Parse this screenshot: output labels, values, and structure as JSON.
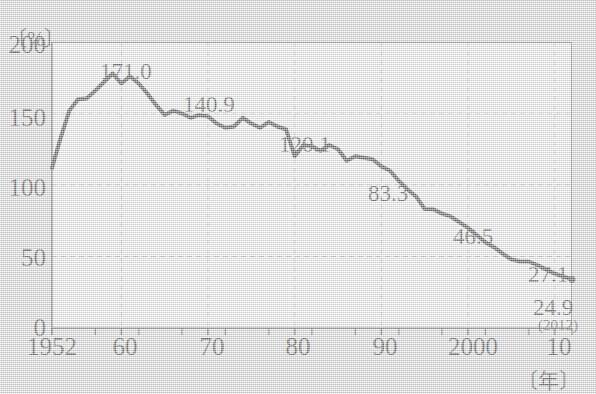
{
  "chart_data": {
    "type": "line",
    "title": "",
    "subtitle": "",
    "xlabel": "〔年〕",
    "ylabel": "〔%〕",
    "xlim": [
      1952,
      2012
    ],
    "ylim": [
      0,
      200
    ],
    "grid": true,
    "legend": "none",
    "y_ticks": [
      0,
      50,
      100,
      150,
      200
    ],
    "y_tick_labels": [
      "0",
      "50",
      "100",
      "150",
      "200"
    ],
    "x_ticks": [
      1952,
      1960,
      1970,
      1980,
      1990,
      2000,
      2010
    ],
    "x_tick_labels": [
      "1952",
      "60",
      "70",
      "80",
      "90",
      "2000",
      "10"
    ],
    "x_minor_tick_step": 5,
    "line_color": "#111111",
    "line_width": 4,
    "plot_bg": "#ffffff",
    "figure_bg": "#e2e2e2",
    "grid_color": "#b9b9b9",
    "x": [
      1952,
      1953,
      1954,
      1955,
      1956,
      1957,
      1958,
      1959,
      1960,
      1961,
      1962,
      1963,
      1964,
      1965,
      1966,
      1967,
      1968,
      1969,
      1970,
      1971,
      1972,
      1973,
      1974,
      1975,
      1976,
      1977,
      1978,
      1979,
      1980,
      1981,
      1982,
      1983,
      1984,
      1985,
      1986,
      1987,
      1988,
      1989,
      1990,
      1991,
      1992,
      1993,
      1994,
      1995,
      1996,
      1997,
      1998,
      1999,
      2000,
      2001,
      2002,
      2003,
      2004,
      2005,
      2006,
      2007,
      2008,
      2009,
      2010,
      2011,
      2012
    ],
    "values": [
      112.0,
      133.0,
      152.0,
      160.0,
      160.5,
      166.0,
      172.0,
      178.0,
      171.0,
      176.0,
      171.0,
      164.0,
      156.0,
      149.0,
      152.0,
      150.0,
      147.0,
      149.0,
      148.0,
      143.0,
      140.0,
      140.9,
      147.0,
      143.0,
      140.0,
      144.0,
      140.9,
      139.0,
      120.1,
      128.0,
      127.0,
      124.0,
      128.0,
      125.0,
      117.0,
      120.1,
      119.0,
      118.0,
      113.0,
      110.0,
      103.0,
      97.0,
      92.0,
      83.3,
      83.0,
      80.0,
      78.0,
      74.0,
      70.0,
      65.0,
      60.0,
      56.5,
      52.0,
      48.0,
      46.5,
      46.5,
      44.0,
      41.0,
      38.0,
      36.0,
      34.0
    ],
    "annotations": [
      {
        "label": "171.0",
        "year": 1960,
        "value": 171.0
      },
      {
        "label": "140.9",
        "year": 1978,
        "value": 140.9
      },
      {
        "label": "120.1",
        "year": 1987,
        "value": 120.1
      },
      {
        "label": "83.3",
        "year": 1990,
        "value": 83.3
      },
      {
        "label": "46.5",
        "year": 2000,
        "value": 46.5
      },
      {
        "label": "27.1",
        "year": 2010,
        "value": 27.1
      },
      {
        "label": "24.9",
        "year": 2011,
        "value": 24.9
      },
      {
        "label": "(2012)",
        "year": 2012,
        "value": null
      }
    ]
  },
  "axis": {
    "unit_y": "〔%〕",
    "unit_x": "〔年〕"
  }
}
